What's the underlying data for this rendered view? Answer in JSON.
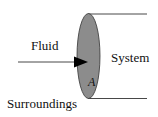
{
  "diagram": {
    "labels": {
      "fluid": "Fluid",
      "system": "System",
      "surroundings": "Surroundings",
      "area": "A"
    },
    "colors": {
      "ellipse_fill": "#8c8c8c",
      "ellipse_stroke": "#333333",
      "line": "#333333",
      "arrow": "#000000",
      "background": "#ffffff"
    }
  }
}
